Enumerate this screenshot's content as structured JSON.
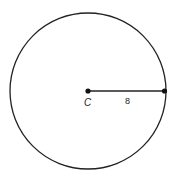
{
  "diagram": {
    "center_label": "C",
    "radius_label": "8",
    "colors": {
      "stroke": "#222222",
      "background": "#ffffff"
    }
  }
}
